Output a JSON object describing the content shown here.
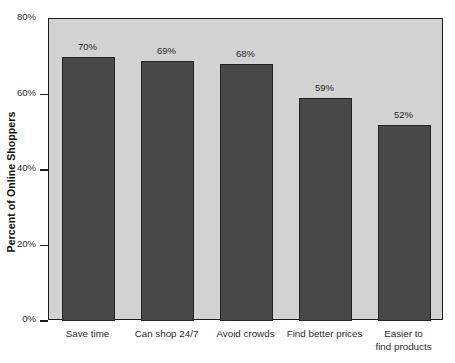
{
  "chart_data": {
    "type": "bar",
    "title": "",
    "subtitle": "",
    "xlabel": "",
    "ylabel": "Percent of Online Shoppers",
    "categories": [
      "Save time",
      "Can shop 24/7",
      "Avoid crowds",
      "Find better prices",
      "Easier to\nfind products"
    ],
    "values": [
      70,
      69,
      68,
      59,
      52
    ],
    "value_labels": [
      "70%",
      "69%",
      "68%",
      "59%",
      "52%"
    ],
    "ylim": [
      0,
      80
    ],
    "yticks": [
      0,
      20,
      40,
      60,
      80
    ],
    "ytick_labels": [
      "0%",
      "20%",
      "40%",
      "60%",
      "80%"
    ],
    "grid": false,
    "legend": null,
    "legend_position": "none",
    "orientation": "vertical",
    "colors": {
      "bar_fill": "#484848",
      "bar_edge": "#232323",
      "plot_background": "#d2d2d2",
      "figure_background": "#ffffff",
      "axis_line": "#1c1c1c",
      "text": "#2a2a2a"
    }
  }
}
